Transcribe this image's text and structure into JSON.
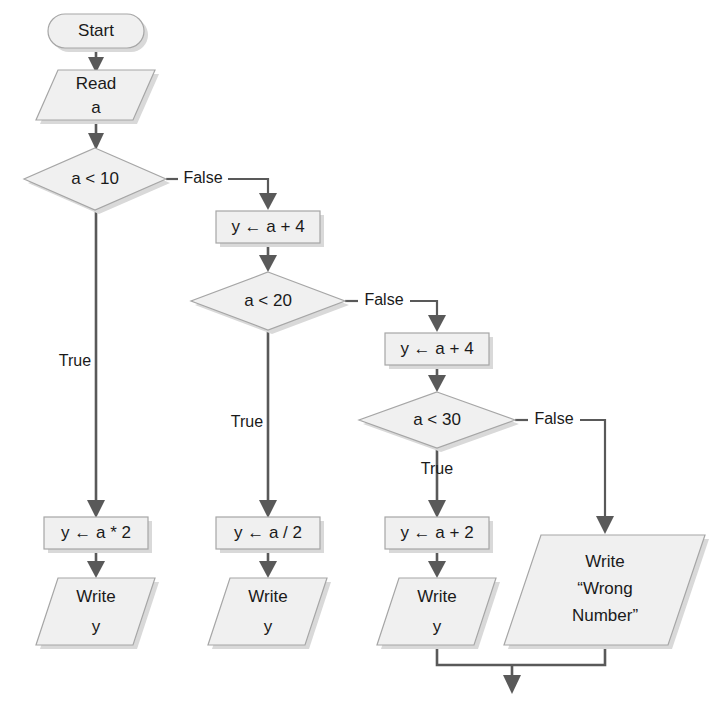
{
  "diagram": {
    "colors": {
      "shape_fill": "#f0f0f0",
      "shape_border": "#a6a6a6",
      "connector": "#595959",
      "shadow": "#d9d9d9",
      "text": "#1a1a1a",
      "background": "#ffffff"
    },
    "nodes": {
      "start": {
        "label": "Start",
        "type": "terminator"
      },
      "read_a": {
        "line1": "Read",
        "line2": "a",
        "type": "input-output"
      },
      "decision_a_lt_10": {
        "label": "a < 10",
        "type": "decision"
      },
      "assign_y_a_plus_4_first": {
        "label": "y ← a + 4",
        "type": "process"
      },
      "decision_a_lt_20": {
        "label": "a < 20",
        "type": "decision"
      },
      "assign_y_a_plus_4_second": {
        "label": "y ← a + 4",
        "type": "process"
      },
      "decision_a_lt_30": {
        "label": "a < 30",
        "type": "decision"
      },
      "assign_y_a_times_2": {
        "label": "y ← a * 2",
        "type": "process"
      },
      "assign_y_a_div_2": {
        "label": "y ← a / 2",
        "type": "process"
      },
      "assign_y_a_plus_2": {
        "label": "y ← a + 2",
        "type": "process"
      },
      "write_y_1": {
        "line1": "Write",
        "line2": "y",
        "type": "input-output"
      },
      "write_y_2": {
        "line1": "Write",
        "line2": "y",
        "type": "input-output"
      },
      "write_y_3": {
        "line1": "Write",
        "line2": "y",
        "type": "input-output"
      },
      "write_wrong_number": {
        "line1": "Write",
        "line2": "“Wrong",
        "line3": "Number”",
        "type": "input-output"
      }
    },
    "edge_labels": {
      "false_1": "False",
      "false_2": "False",
      "false_3": "False",
      "true_1": "True",
      "true_2": "True",
      "true_3": "True"
    }
  }
}
